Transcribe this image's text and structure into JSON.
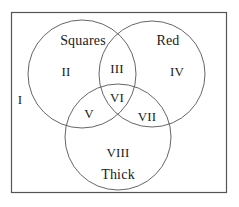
{
  "figure": {
    "type": "venn-diagram",
    "set_count": 3,
    "background_color": "#ffffff",
    "stroke_color": "#555555",
    "text_color": "#1a1a1a",
    "universe": {
      "name": "universe-rectangle",
      "x": 11,
      "y": 12,
      "width": 216,
      "height": 181
    }
  },
  "circles": [
    {
      "id": "squares",
      "label": "Squares",
      "cx": 82,
      "cy": 74,
      "r": 54
    },
    {
      "id": "red",
      "label": "Red",
      "cx": 152,
      "cy": 74,
      "r": 53
    },
    {
      "id": "thick",
      "label": "Thick",
      "cx": 118,
      "cy": 137,
      "r": 53
    }
  ],
  "set_labels": {
    "squares": "Squares",
    "red": "Red",
    "thick": "Thick"
  },
  "regions": [
    {
      "id": "I",
      "label": "I",
      "x": 20,
      "y": 99,
      "description": "outside all sets"
    },
    {
      "id": "II",
      "label": "II",
      "x": 66,
      "y": 71,
      "description": "Squares only"
    },
    {
      "id": "III",
      "label": "III",
      "x": 117,
      "y": 68,
      "description": "Squares and Red"
    },
    {
      "id": "IV",
      "label": "IV",
      "x": 177,
      "y": 71,
      "description": "Red only"
    },
    {
      "id": "V",
      "label": "V",
      "x": 89,
      "y": 113,
      "description": "Squares and Thick"
    },
    {
      "id": "VI",
      "label": "VI",
      "x": 117,
      "y": 97,
      "description": "Squares and Red and Thick"
    },
    {
      "id": "VII",
      "label": "VII",
      "x": 147,
      "y": 116,
      "description": "Red and Thick"
    },
    {
      "id": "VIII",
      "label": "VIII",
      "x": 118,
      "y": 152,
      "description": "Thick only"
    }
  ],
  "name_labels": [
    {
      "id": "squares",
      "label": "Squares",
      "x": 83,
      "y": 41
    },
    {
      "id": "red",
      "label": "Red",
      "x": 168,
      "y": 41
    },
    {
      "id": "thick",
      "label": "Thick",
      "x": 118,
      "y": 175
    }
  ]
}
